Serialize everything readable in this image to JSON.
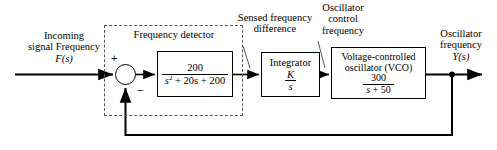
{
  "diagram": {
    "input_label": {
      "line1": "Incoming",
      "line2": "signal Frequency",
      "line3": "F(s)"
    },
    "output_label": {
      "line1": "Oscillator",
      "line2": "frequency",
      "line3": "Y(s)"
    },
    "annotations": {
      "sensed_difference": {
        "line1": "Sensed frequency",
        "line2": "difference"
      },
      "oscillator_control": {
        "line1": "Oscillator",
        "line2": "control",
        "line3": "frequency"
      }
    },
    "subsystem": {
      "name": "frequency-detector-group",
      "label": "Frequency detector"
    },
    "summing_junction": {
      "plus_sign": "+",
      "minus_sign": "−"
    },
    "blocks": [
      {
        "name": "frequency-detector",
        "title": "",
        "numerator": "200",
        "denominator_pre": "s",
        "denominator_exp": "2",
        "denominator_post": " + 20s + 200"
      },
      {
        "name": "integrator",
        "title": "Integrator",
        "numerator": "K",
        "denominator": "s"
      },
      {
        "name": "voltage-controlled-oscillator",
        "title_line1": "Voltage-controlled",
        "title_line2": "oscillator (VCO)",
        "numerator": "300",
        "denominator_pre": "s",
        "denominator_post": " + 50"
      }
    ],
    "colors": {
      "line": "#000000",
      "dashed_border": "#555555",
      "background": "#ffffff"
    }
  }
}
